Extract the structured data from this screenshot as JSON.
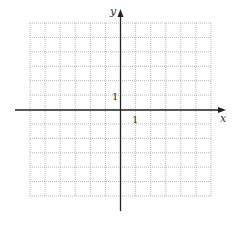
{
  "graph": {
    "x_label": "x",
    "y_label": "y",
    "x_tick_label": "1",
    "y_tick_label": "1",
    "x_range": [
      -6,
      6
    ],
    "y_range": [
      -6,
      6
    ],
    "grid_style": "dotted",
    "colors": {
      "axis": "#222222",
      "grid": "#b8b8b8",
      "background": "#ffffff"
    }
  }
}
